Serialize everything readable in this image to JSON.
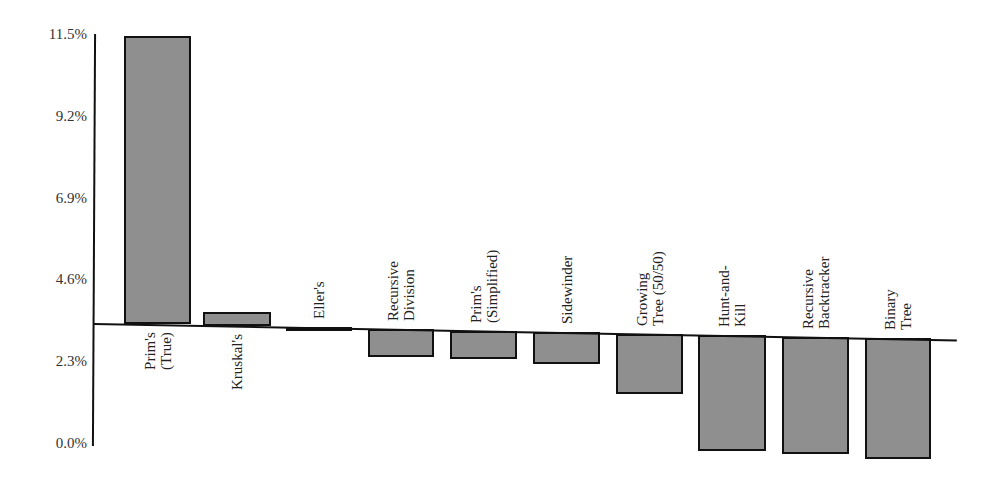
{
  "chart_data": {
    "type": "bar",
    "title": "",
    "xlabel": "",
    "ylabel": "",
    "ylim": [
      0.0,
      11.5
    ],
    "yticks": [
      "0.0%",
      "2.3%",
      "4.6%",
      "6.9%",
      "9.2%",
      "11.5%"
    ],
    "baseline_value": 3.4,
    "grid": false,
    "legend": null,
    "categories": [
      "Prim's (True)",
      "Kruskal's",
      "Eller's",
      "Recursive Division",
      "Prim's (Simplified)",
      "Sidewinder",
      "Growing Tree (50/50)",
      "Hunt-and-Kill",
      "Recursive Backtracker",
      "Binary Tree"
    ],
    "labels_display": [
      "Prim's\n(True)",
      "Kruskal's",
      "Eller's",
      "Recursive\nDivision",
      "Prim's\n(Simplified)",
      "Sidewinder",
      "Growing\nTree (50/50)",
      "Hunt-and-\nKill",
      "Recursive\nBacktracker",
      "Binary\nTree"
    ],
    "values": [
      11.5,
      3.8,
      3.3,
      2.6,
      2.6,
      2.5,
      1.7,
      0.15,
      0.1,
      0.0
    ],
    "units": "%",
    "bar_color": "#8f8f8f",
    "edge_color": "#111111"
  }
}
